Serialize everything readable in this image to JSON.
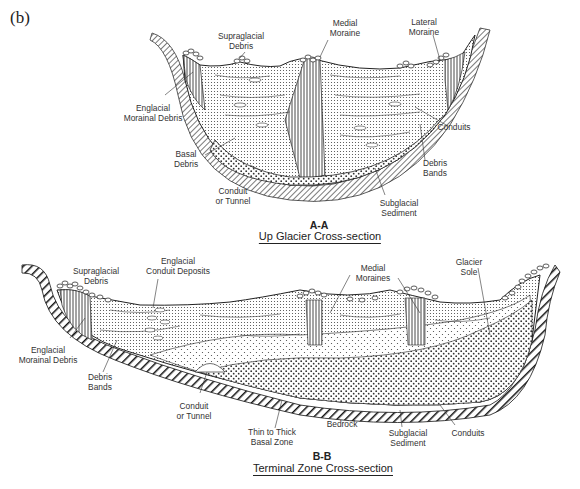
{
  "panel_label": "(b)",
  "sections": [
    {
      "id": "A-A",
      "title": "Up Glacier Cross-section",
      "labels": {
        "supraglacial_debris": [
          "Supraglacial",
          "Debris"
        ],
        "medial_moraine": [
          "Medial",
          "Moraine"
        ],
        "lateral_moraine": [
          "Lateral",
          "Moraine"
        ],
        "englacial_morainal_debris": [
          "Englacial",
          "Morainal Debris"
        ],
        "conduits": [
          "Conduits"
        ],
        "basal_debris": [
          "Basal",
          "Debris"
        ],
        "debris_bands": [
          "Debris",
          "Bands"
        ],
        "conduit_or_tunnel": [
          "Conduit",
          "or Tunnel"
        ],
        "subglacial_sediment": [
          "Subglacial",
          "Sediment"
        ]
      }
    },
    {
      "id": "B-B",
      "title": "Terminal Zone Cross-section",
      "labels": {
        "supraglacial_debris": [
          "Supraglacial",
          "Debris"
        ],
        "englacial_conduit_deposits": [
          "Englacial",
          "Conduit Deposits"
        ],
        "medial_moraines": [
          "Medial",
          "Moraines"
        ],
        "glacier_sole": [
          "Glacier",
          "Sole"
        ],
        "englacial_morainal_debris": [
          "Englacial",
          "Morainal Debris"
        ],
        "debris_bands": [
          "Debris",
          "Bands"
        ],
        "conduit_or_tunnel": [
          "Conduit",
          "or Tunnel"
        ],
        "thin_to_thick_basal_zone": [
          "Thin to Thick",
          "Basal Zone"
        ],
        "bedrock": [
          "Bedrock"
        ],
        "subglacial_sediment": [
          "Subglacial",
          "Sediment"
        ],
        "conduits": [
          "Conduits"
        ]
      }
    }
  ]
}
